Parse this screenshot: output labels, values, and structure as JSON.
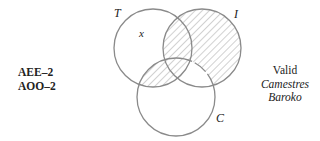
{
  "diagram": {
    "type": "venn-3",
    "circles": [
      {
        "id": "T",
        "label": "T",
        "cx": 153,
        "cy": 48,
        "r": 39
      },
      {
        "id": "I",
        "label": "I",
        "cx": 202,
        "cy": 48,
        "r": 39
      },
      {
        "id": "C",
        "label": "C",
        "cx": 176,
        "cy": 97,
        "r": 39
      }
    ],
    "shaded_regions": [
      "I outside C",
      "T inside C"
    ],
    "marks": [
      {
        "symbol": "x",
        "region": "T only"
      }
    ],
    "stroke_color": "#8a8a8a",
    "hatch_color": "#9a9a9a"
  },
  "left_labels": {
    "line1": "AEE–2",
    "line2": "AOO–2"
  },
  "right_labels": {
    "verdict": "Valid",
    "name1": "Camestres",
    "name2": "Baroko"
  }
}
